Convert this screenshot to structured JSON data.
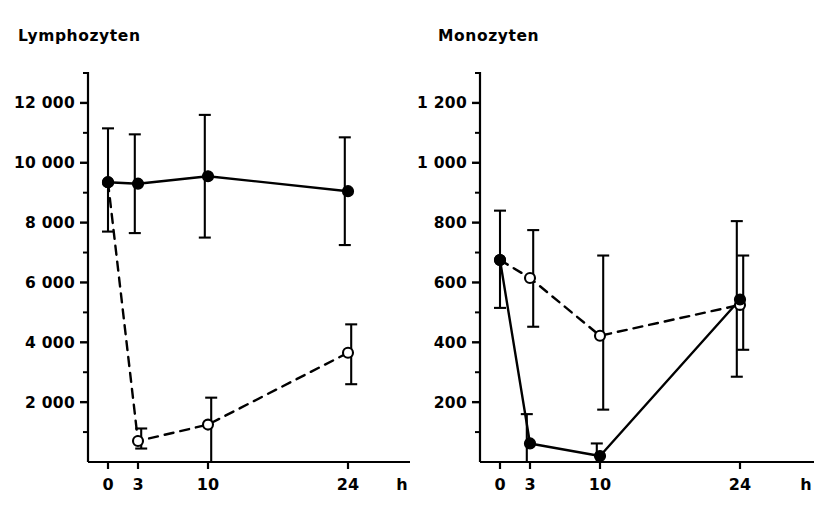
{
  "figure": {
    "background": "#ffffff",
    "ink_color": "#000000",
    "width": 828,
    "height": 513
  },
  "panels": [
    {
      "id": "lymphozyten",
      "title": "Lymphozyten",
      "x_unit_label": "h"
    },
    {
      "id": "monozyten",
      "title": "Monozyten",
      "x_unit_label": "h"
    }
  ],
  "chart_data": [
    {
      "type": "line",
      "title": "Lymphozyten",
      "xlabel": "h",
      "ylabel": "",
      "x": [
        0,
        3,
        10,
        24
      ],
      "xtick_labels": [
        "0",
        "3",
        "10",
        "24"
      ],
      "xlim": [
        -1.5,
        29
      ],
      "ylim": [
        0,
        13000
      ],
      "yticks": [
        2000,
        4000,
        6000,
        8000,
        10000,
        12000
      ],
      "ytick_labels": [
        "2 000",
        "4 000",
        "6 000",
        "8 000",
        "10 000",
        "12 000"
      ],
      "yminor_ticks": [
        1000,
        3000,
        5000,
        7000,
        9000,
        11000,
        13000
      ],
      "grid": false,
      "legend": false,
      "series": [
        {
          "name": "filled-solid",
          "marker": "filled-circle",
          "line": "solid",
          "values": [
            9350,
            9300,
            9550,
            9050
          ],
          "err_low": [
            7700,
            7650,
            7500,
            7250
          ],
          "err_high": [
            11150,
            10950,
            11600,
            10850
          ]
        },
        {
          "name": "open-dashed",
          "marker": "open-circle",
          "line": "dashed",
          "values": [
            9350,
            700,
            1250,
            3650
          ],
          "err_low": [
            7700,
            450,
            0,
            2600
          ],
          "err_high": [
            11150,
            1120,
            2150,
            4600
          ]
        }
      ]
    },
    {
      "type": "line",
      "title": "Monozyten",
      "xlabel": "h",
      "ylabel": "",
      "x": [
        0,
        3,
        10,
        24
      ],
      "xtick_labels": [
        "0",
        "3",
        "10",
        "24"
      ],
      "xlim": [
        -1.5,
        29
      ],
      "ylim": [
        0,
        1300
      ],
      "yticks": [
        200,
        400,
        600,
        800,
        1000,
        1200
      ],
      "ytick_labels": [
        "200",
        "400",
        "600",
        "800",
        "1 000",
        "1 200"
      ],
      "yminor_ticks": [
        100,
        300,
        500,
        700,
        900,
        1100,
        1300
      ],
      "grid": false,
      "legend": false,
      "series": [
        {
          "name": "filled-solid",
          "marker": "filled-circle",
          "line": "solid",
          "values": [
            675,
            62,
            20,
            543
          ],
          "err_low": [
            515,
            0,
            0,
            285
          ],
          "err_high": [
            840,
            160,
            62,
            805
          ]
        },
        {
          "name": "open-dashed",
          "marker": "open-circle",
          "line": "dashed",
          "values": [
            675,
            615,
            422,
            525
          ],
          "err_low": [
            515,
            452,
            175,
            375
          ],
          "err_high": [
            840,
            775,
            690,
            690
          ]
        }
      ]
    }
  ]
}
